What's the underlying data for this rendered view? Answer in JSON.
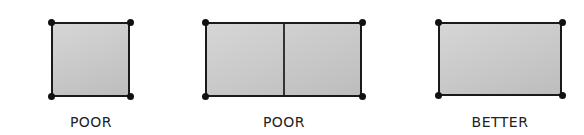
{
  "figures": [
    {
      "label": "POOR",
      "kind": "square"
    },
    {
      "label": "POOR",
      "kind": "divided-rectangle"
    },
    {
      "label": "BETTER",
      "kind": "rectangle"
    }
  ],
  "colors": {
    "fill": "#c8c8c8",
    "stroke": "#1a1a1a"
  }
}
